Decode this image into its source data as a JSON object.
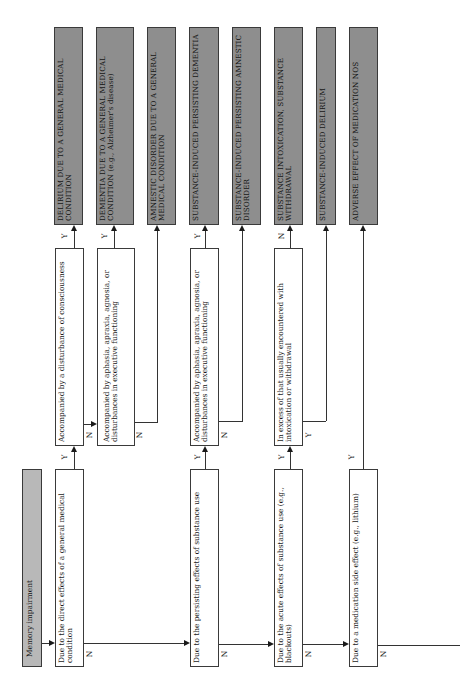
{
  "diagram": {
    "orientation": "rotated 90 degrees counter-clockwise; text reads bottom-to-top",
    "start": {
      "label": "Memory impairment"
    },
    "main_questions": [
      {
        "id": "q1",
        "label": "Due to the direct effects of a general medical condition",
        "yes": "Y",
        "no": "N"
      },
      {
        "id": "q2",
        "label": "Due to the persisting effects of substance use",
        "yes": "Y",
        "no": "N"
      },
      {
        "id": "q3",
        "label": "Due to the acute effects of substance use (e.g., blackouts)",
        "yes": "Y",
        "no": "N"
      },
      {
        "id": "q4",
        "label": "Due to a medication side effect (e.g., lithium)",
        "yes": "Y",
        "no": "N"
      }
    ],
    "sub_questions": [
      {
        "id": "s1",
        "label": "Accompanied by a disturbance of consciousness",
        "yes": "Y",
        "no": "N"
      },
      {
        "id": "s2",
        "label": "Accompanied by aphasia, apraxia, agnosia, or disturbances in executive functioning",
        "yes": "Y",
        "no": "N"
      },
      {
        "id": "s3",
        "label": "Accompanied by aphasia, apraxia, agnosia, or disturbances in executive functioning",
        "yes": "Y",
        "no": "N"
      },
      {
        "id": "s4",
        "label": "In excess of that usually encountered with intoxication or withdrawal",
        "yes": "Y",
        "no": "N"
      }
    ],
    "results": [
      {
        "id": "r1",
        "label": "DELIRIUM DUE TO A GENERAL MEDICAL CONDITION",
        "note": ""
      },
      {
        "id": "r2",
        "label": "DEMENTIA DUE TO A GENERAL MEDICAL CONDITION",
        "note": "(e.g., Alzheimer's disease)"
      },
      {
        "id": "r3",
        "label": "AMNESTIC DISORDER DUE TO A GENERAL MEDICAL CONDITION",
        "note": ""
      },
      {
        "id": "r4",
        "label": "SUBSTANCE-INDUCED PERSISTING DEMENTIA",
        "note": ""
      },
      {
        "id": "r5",
        "label": "SUBSTANCE-INDUCED PERSISTING AMNESTIC DISORDER",
        "note": ""
      },
      {
        "id": "r6",
        "label": "SUBSTANCE INTOXICATION, SUBSTANCE WITHDRAWAL",
        "note": ""
      },
      {
        "id": "r7",
        "label": "SUBSTANCE-INDUCED DELIRIUM",
        "note": ""
      },
      {
        "id": "r8",
        "label": "ADVERSE EFFECT OF MEDICATION NOS",
        "note": ""
      }
    ],
    "colors": {
      "result_fill": "#8e8e8e",
      "start_fill": "#b8b8b8",
      "box_border": "#3a3a3a",
      "line": "#333333"
    }
  }
}
